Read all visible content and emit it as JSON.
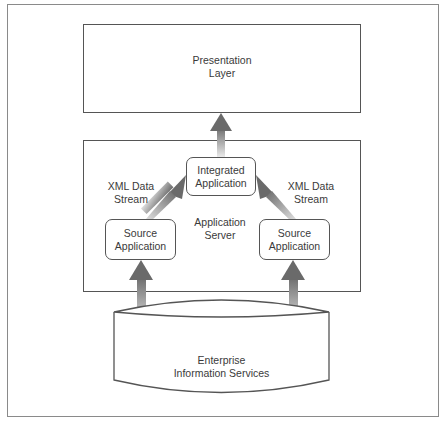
{
  "diagram": {
    "presentation_layer": {
      "label": "Presentation\nLayer"
    },
    "application_server": {
      "label": "Application\nServer"
    },
    "integrated_application": {
      "label": "Integrated\nApplication"
    },
    "source_application_left": {
      "label": "Source\nApplication"
    },
    "source_application_right": {
      "label": "Source\nApplication"
    },
    "xml_stream_left": {
      "label": "XML Data\nStream"
    },
    "xml_stream_right": {
      "label": "XML Data\nStream"
    },
    "enterprise_information_services": {
      "label": "Enterprise\nInformation Services"
    },
    "colors": {
      "border": "#555555",
      "arrow_dark": "#6e6e6e",
      "arrow_light": "#e6e6e6",
      "frame": "#8a8a8a"
    }
  }
}
